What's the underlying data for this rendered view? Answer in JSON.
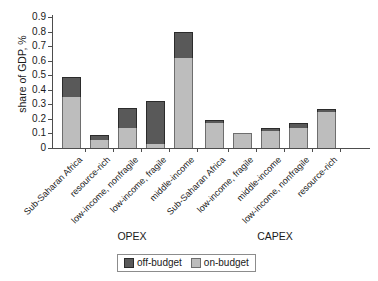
{
  "chart_data": {
    "type": "bar",
    "title": "",
    "xlabel": "",
    "ylabel": "share of GDP, %",
    "ylim": [
      0,
      0.9
    ],
    "ytick_labels": [
      "0.9",
      "0.8",
      "0.7",
      "0.6",
      "0.5",
      "0.4",
      "0.3",
      "0.2",
      "0.1",
      "0"
    ],
    "ytick_values": [
      0.9,
      0.8,
      0.7,
      0.6,
      0.5,
      0.4,
      0.3,
      0.2,
      0.1,
      0
    ],
    "grid": false,
    "stacked": true,
    "legend_position": "bottom",
    "legend": [
      "off-budget",
      "on-budget"
    ],
    "colors": {
      "off_budget": "#595959",
      "on_budget": "#bdbdbd",
      "axis": "#4d4d4d",
      "text": "#1a1a1a"
    },
    "groups": [
      {
        "name": "OPEX",
        "categories": [
          "Sub-Saharan Africa",
          "resource-rich",
          "low-income, nonfragile",
          "low-income, fragile",
          "middle-income"
        ],
        "series": [
          {
            "name": "on-budget",
            "values": [
              0.35,
              0.055,
              0.14,
              0.03,
              0.615
            ]
          },
          {
            "name": "off-budget",
            "values": [
              0.135,
              0.035,
              0.135,
              0.29,
              0.185
            ]
          }
        ],
        "totals": [
          0.485,
          0.09,
          0.275,
          0.32,
          0.8
        ]
      },
      {
        "name": "CAPEX",
        "categories": [
          "Sub-Saharan Africa",
          "low-income, fragile",
          "middle-income",
          "low-income, nonfragile",
          "resource-rich"
        ],
        "series": [
          {
            "name": "on-budget",
            "values": [
              0.175,
              0.1,
              0.115,
              0.135,
              0.245
            ]
          },
          {
            "name": "off-budget",
            "values": [
              0.02,
              0.0,
              0.02,
              0.04,
              0.025
            ]
          }
        ],
        "totals": [
          0.195,
          0.1,
          0.135,
          0.175,
          0.27
        ]
      }
    ]
  }
}
